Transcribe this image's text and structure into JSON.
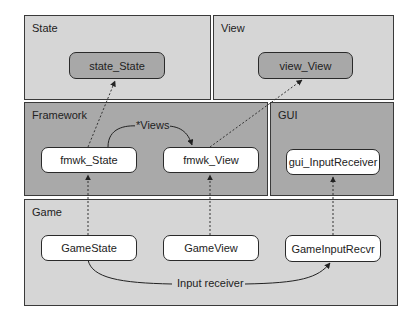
{
  "diagram": {
    "panels": {
      "state": {
        "label": "State"
      },
      "view": {
        "label": "View"
      },
      "framework": {
        "label": "Framework"
      },
      "gui": {
        "label": "GUI"
      },
      "game": {
        "label": "Game"
      }
    },
    "nodes": {
      "state_state": "state_State",
      "view_view": "view_View",
      "fmwk_state": "fmwk_State",
      "fmwk_view": "fmwk_View",
      "gui_input_receiver": "gui_InputReceiver",
      "game_state": "GameState",
      "game_view": "GameView",
      "game_input_recvr": "GameInputRecvr"
    },
    "edges": {
      "views_label": "*Views",
      "input_receiver_label": "Input receiver"
    },
    "colors": {
      "light_panel": "#d6d6d6",
      "dark_panel": "#a9a9a9",
      "border": "#3a3a3a",
      "node_white": "#ffffff",
      "node_grey": "#a8a8a8"
    }
  }
}
